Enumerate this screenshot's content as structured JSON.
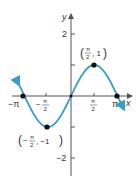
{
  "chart_data": {
    "type": "line",
    "title": "",
    "function": "y = sin(x)",
    "xlabel": "x",
    "ylabel": "y",
    "xlim": [
      -3.6,
      3.6
    ],
    "ylim": [
      -2.4,
      2.4
    ],
    "grid": false,
    "x_ticks": [
      {
        "value": -3.14159,
        "label": "−π"
      },
      {
        "value": -1.5708,
        "label": "−π/2"
      },
      {
        "value": 1.5708,
        "label": "π/2"
      },
      {
        "value": 3.14159,
        "label": "π"
      }
    ],
    "y_ticks": [
      {
        "value": 2,
        "label": "2"
      },
      {
        "value": 1,
        "label": ""
      },
      {
        "value": -1,
        "label": ""
      },
      {
        "value": -2,
        "label": "−2"
      }
    ],
    "series": [
      {
        "name": "sin(x)",
        "color": "#3a9cc8",
        "x_range": [
          -3.55,
          3.55
        ],
        "arrows": "both"
      }
    ],
    "points": [
      {
        "x": -3.14159,
        "y": 0,
        "label": ""
      },
      {
        "x": 0,
        "y": 0,
        "label": ""
      },
      {
        "x": 3.14159,
        "y": 0,
        "label": ""
      },
      {
        "x": 1.5708,
        "y": 1,
        "label": "(π/2, 1)"
      },
      {
        "x": -1.5708,
        "y": -1,
        "label": "(−π/2, −1)"
      }
    ],
    "annotations": [
      {
        "text": "(π/2, 1)",
        "near": [
          1.5708,
          1
        ]
      },
      {
        "text": "(−π/2, −1)",
        "near": [
          -1.5708,
          -1
        ]
      }
    ]
  },
  "labels": {
    "x_axis": "x",
    "y_axis": "y",
    "tick_neg_pi": "−π",
    "tick_pi": "π",
    "tick_neg_pi_half_num": "π",
    "tick_pi_half_num": "π",
    "tick_half_den": "2",
    "tick_y2": "2",
    "tick_yneg2": "−2",
    "point_max": "(π/2, 1)",
    "point_min": "(−π/2, −1)"
  }
}
